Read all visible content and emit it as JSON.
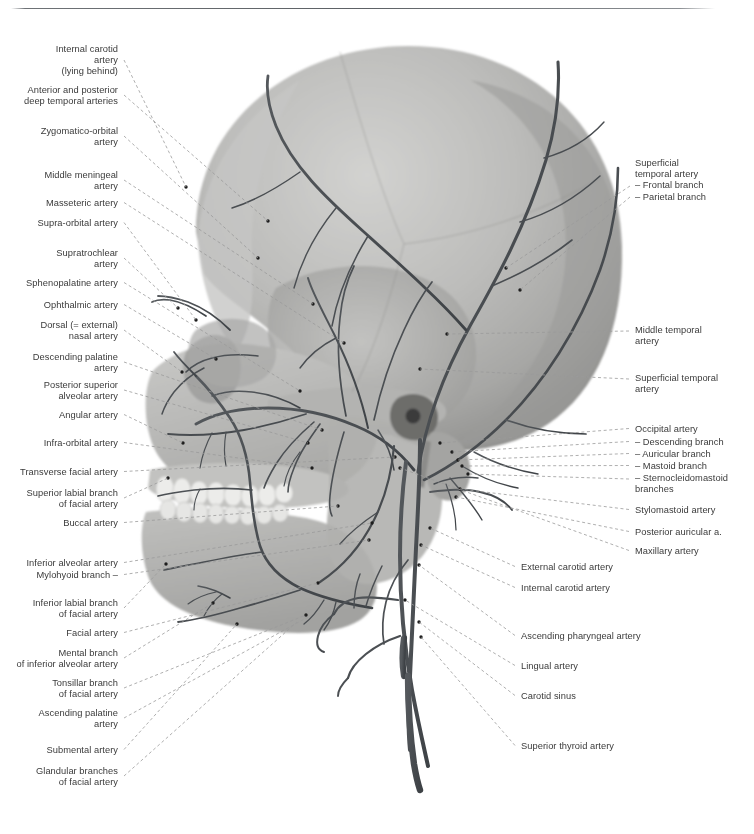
{
  "figure": {
    "top_rule_color": "#5d6165",
    "label_color": "#3a3a3a",
    "leader_color": "#9a9a9a",
    "artery_color": "#4a4e52",
    "bone_color": "#b9b9b7"
  },
  "labels_left": [
    {
      "id": "internal-carotid-artery-lying-behind",
      "text": "Internal carotid\nartery\n(lying behind)",
      "x": 118,
      "y": 44,
      "anchor_x": 186,
      "anchor_y": 187
    },
    {
      "id": "anterior-and-posterior-deep-temporal-arteries",
      "text": "Anterior and posterior\ndeep temporal arteries",
      "x": 118,
      "y": 85,
      "anchor_x": 268,
      "anchor_y": 221
    },
    {
      "id": "zygomatico-orbital-artery",
      "text": "Zygomatico-orbital\nartery",
      "x": 118,
      "y": 126,
      "anchor_x": 258,
      "anchor_y": 258
    },
    {
      "id": "middle-meningeal-artery",
      "text": "Middle meningeal\nartery",
      "x": 118,
      "y": 170,
      "anchor_x": 313,
      "anchor_y": 304
    },
    {
      "id": "masseteric-artery",
      "text": "Masseteric artery",
      "x": 118,
      "y": 198,
      "anchor_x": 344,
      "anchor_y": 343
    },
    {
      "id": "supra-orbital-artery",
      "text": "Supra-orbital artery",
      "x": 118,
      "y": 218,
      "anchor_x": 196,
      "anchor_y": 320
    },
    {
      "id": "supratrochlear-artery",
      "text": "Supratrochlear\nartery",
      "x": 118,
      "y": 248,
      "anchor_x": 178,
      "anchor_y": 308
    },
    {
      "id": "sphenopalatine-artery",
      "text": "Sphenopalatine artery",
      "x": 118,
      "y": 278,
      "anchor_x": 300,
      "anchor_y": 391
    },
    {
      "id": "ophthalmic-artery",
      "text": "Ophthalmic artery",
      "x": 118,
      "y": 300,
      "anchor_x": 216,
      "anchor_y": 359
    },
    {
      "id": "dorsal-external-nasal-artery",
      "text": "Dorsal (= external)\nnasal artery",
      "x": 118,
      "y": 320,
      "anchor_x": 182,
      "anchor_y": 372
    },
    {
      "id": "descending-palatine-artery",
      "text": "Descending palatine\nartery",
      "x": 118,
      "y": 352,
      "anchor_x": 322,
      "anchor_y": 430
    },
    {
      "id": "posterior-superior-alveolar-artery",
      "text": "Posterior superior\nalveolar artery",
      "x": 118,
      "y": 380,
      "anchor_x": 308,
      "anchor_y": 443
    },
    {
      "id": "angular-artery",
      "text": "Angular artery",
      "x": 118,
      "y": 410,
      "anchor_x": 183,
      "anchor_y": 443
    },
    {
      "id": "infra-orbital-artery",
      "text": "Infra-orbital artery",
      "x": 118,
      "y": 438,
      "anchor_x": 312,
      "anchor_y": 468
    },
    {
      "id": "transverse-facial-artery",
      "text": "Transverse facial artery",
      "x": 118,
      "y": 467,
      "anchor_x": 395,
      "anchor_y": 457
    },
    {
      "id": "superior-labial-branch-of-facial-artery",
      "text": "Superior labial branch\nof facial artery",
      "x": 118,
      "y": 488,
      "anchor_x": 168,
      "anchor_y": 478
    },
    {
      "id": "buccal-artery",
      "text": "Buccal artery",
      "x": 118,
      "y": 518,
      "anchor_x": 338,
      "anchor_y": 506
    },
    {
      "id": "inferior-alveolar-artery",
      "text": "Inferior alveolar artery",
      "x": 118,
      "y": 558,
      "anchor_x": 372,
      "anchor_y": 523
    },
    {
      "id": "mylohyoid-branch",
      "text": "Mylohyoid branch –",
      "x": 118,
      "y": 570,
      "anchor_x": 369,
      "anchor_y": 540
    },
    {
      "id": "inferior-labial-branch-of-facial-artery",
      "text": "Inferior labial branch\nof facial artery",
      "x": 118,
      "y": 598,
      "anchor_x": 166,
      "anchor_y": 564
    },
    {
      "id": "facial-artery",
      "text": "Facial artery",
      "x": 118,
      "y": 628,
      "anchor_x": 318,
      "anchor_y": 583
    },
    {
      "id": "mental-branch-of-inferior-alveolar-artery",
      "text": "Mental branch\nof inferior alveolar artery",
      "x": 118,
      "y": 648,
      "anchor_x": 213,
      "anchor_y": 603
    },
    {
      "id": "tonsillar-branch-of-facial-artery",
      "text": "Tonsillar branch\nof facial artery",
      "x": 118,
      "y": 678,
      "anchor_x": 306,
      "anchor_y": 615
    },
    {
      "id": "ascending-palatine-artery",
      "text": "Ascending palatine\nartery",
      "x": 118,
      "y": 708,
      "anchor_x": 308,
      "anchor_y": 617
    },
    {
      "id": "submental-artery",
      "text": "Submental artery",
      "x": 118,
      "y": 745,
      "anchor_x": 237,
      "anchor_y": 624
    },
    {
      "id": "glandular-branches-of-facial-artery",
      "text": "Glandular branches\nof facial artery",
      "x": 118,
      "y": 766,
      "anchor_x": 297,
      "anchor_y": 622
    }
  ],
  "labels_right": [
    {
      "id": "superficial-temporal-artery-branches",
      "text": "Superficial\ntemporal artery\n– Frontal branch\n– Parietal branch",
      "x": 635,
      "y": 158,
      "anchor_x": 609,
      "anchor_y": 0,
      "leaders": [
        {
          "x1": 630,
          "y1": 186,
          "x2": 506,
          "y2": 268
        },
        {
          "x1": 630,
          "y1": 197,
          "x2": 520,
          "y2": 290
        }
      ]
    },
    {
      "id": "middle-temporal-artery",
      "text": "Middle temporal\nartery",
      "x": 635,
      "y": 325,
      "anchor_x": 447,
      "anchor_y": 334
    },
    {
      "id": "superficial-temporal-artery",
      "text": "Superficial temporal\nartery",
      "x": 635,
      "y": 373,
      "anchor_x": 420,
      "anchor_y": 369
    },
    {
      "id": "occipital-artery",
      "text": "Occipital artery",
      "x": 635,
      "y": 424,
      "anchor_x": 440,
      "anchor_y": 443
    },
    {
      "id": "descending-branch",
      "text": "– Descending branch",
      "x": 635,
      "y": 437,
      "anchor_x": 452,
      "anchor_y": 452
    },
    {
      "id": "auricular-branch",
      "text": "– Auricular branch",
      "x": 635,
      "y": 449,
      "anchor_x": 458,
      "anchor_y": 460
    },
    {
      "id": "mastoid-branch",
      "text": "– Mastoid branch",
      "x": 635,
      "y": 461,
      "anchor_x": 462,
      "anchor_y": 466
    },
    {
      "id": "sternocleidomastoid-branches",
      "text": "– Sternocleidomastoid\n   branches",
      "x": 635,
      "y": 473,
      "anchor_x": 468,
      "anchor_y": 474
    },
    {
      "id": "stylomastoid-artery",
      "text": "Stylomastoid artery",
      "x": 635,
      "y": 505,
      "anchor_x": 460,
      "anchor_y": 489
    },
    {
      "id": "posterior-auricular-artery",
      "text": "Posterior auricular a.",
      "x": 635,
      "y": 527,
      "anchor_x": 456,
      "anchor_y": 497
    },
    {
      "id": "maxillary-artery",
      "text": "Maxillary artery",
      "x": 635,
      "y": 546,
      "anchor_x": 400,
      "anchor_y": 468
    },
    {
      "id": "external-carotid-artery",
      "text": "External carotid artery",
      "x": 521,
      "y": 562,
      "anchor_x": 430,
      "anchor_y": 528
    },
    {
      "id": "internal-carotid-artery",
      "text": "Internal carotid artery",
      "x": 521,
      "y": 583,
      "anchor_x": 421,
      "anchor_y": 545
    },
    {
      "id": "ascending-pharyngeal-artery",
      "text": "Ascending pharyngeal artery",
      "x": 521,
      "y": 631,
      "anchor_x": 419,
      "anchor_y": 565
    },
    {
      "id": "lingual-artery",
      "text": "Lingual artery",
      "x": 521,
      "y": 661,
      "anchor_x": 405,
      "anchor_y": 600
    },
    {
      "id": "carotid-sinus",
      "text": "Carotid sinus",
      "x": 521,
      "y": 691,
      "anchor_x": 419,
      "anchor_y": 622
    },
    {
      "id": "superior-thyroid-artery",
      "text": "Superior thyroid artery",
      "x": 521,
      "y": 741,
      "anchor_x": 421,
      "anchor_y": 637
    }
  ]
}
